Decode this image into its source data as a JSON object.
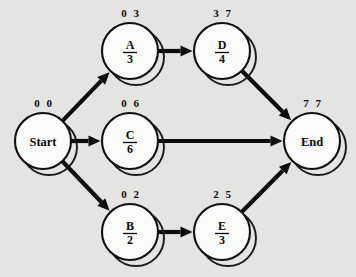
{
  "diagram": {
    "type": "activity-on-node-network",
    "background_color": "#e4e4e3",
    "line_color": "#0c0c0c",
    "node_fill_color": "#fbfbfa",
    "width": 356,
    "height": 277
  },
  "chart_data": {
    "type": "diagram",
    "title": "",
    "nodes": [
      {
        "id": "start",
        "name": "Start",
        "duration": "",
        "early_start": "0",
        "early_finish": "0",
        "times_label": "0  0",
        "is_terminal": true,
        "cx": 43,
        "cy": 141,
        "r": 28
      },
      {
        "id": "a",
        "name": "A",
        "duration": "3",
        "early_start": "0",
        "early_finish": "3",
        "times_label": "0  3",
        "is_terminal": false,
        "cx": 130,
        "cy": 51,
        "r": 28
      },
      {
        "id": "c",
        "name": "C",
        "duration": "6",
        "early_start": "0",
        "early_finish": "6",
        "times_label": "0  6",
        "is_terminal": false,
        "cx": 130,
        "cy": 141,
        "r": 28
      },
      {
        "id": "b",
        "name": "B",
        "duration": "2",
        "early_start": "0",
        "early_finish": "2",
        "times_label": "0  2",
        "is_terminal": false,
        "cx": 130,
        "cy": 232,
        "r": 28
      },
      {
        "id": "d",
        "name": "D",
        "duration": "4",
        "early_start": "3",
        "early_finish": "7",
        "times_label": "3  7",
        "is_terminal": false,
        "cx": 222,
        "cy": 51,
        "r": 28
      },
      {
        "id": "e",
        "name": "E",
        "duration": "3",
        "early_start": "2",
        "early_finish": "5",
        "times_label": "2  5",
        "is_terminal": false,
        "cx": 222,
        "cy": 232,
        "r": 28
      },
      {
        "id": "end",
        "name": "End",
        "duration": "",
        "early_start": "7",
        "early_finish": "7",
        "times_label": "7  7",
        "is_terminal": true,
        "cx": 312,
        "cy": 141,
        "r": 28
      }
    ],
    "edges": [
      {
        "id": "start-a",
        "from": "start",
        "to": "a",
        "label": ""
      },
      {
        "id": "start-c",
        "from": "start",
        "to": "c",
        "label": ""
      },
      {
        "id": "start-b",
        "from": "start",
        "to": "b",
        "label": ""
      },
      {
        "id": "a-d",
        "from": "a",
        "to": "d",
        "label": ""
      },
      {
        "id": "d-end",
        "from": "d",
        "to": "end",
        "label": ""
      },
      {
        "id": "c-end",
        "from": "c",
        "to": "end",
        "label": ""
      },
      {
        "id": "b-e",
        "from": "b",
        "to": "e",
        "label": ""
      },
      {
        "id": "e-end",
        "from": "e",
        "to": "end",
        "label": ""
      }
    ]
  }
}
